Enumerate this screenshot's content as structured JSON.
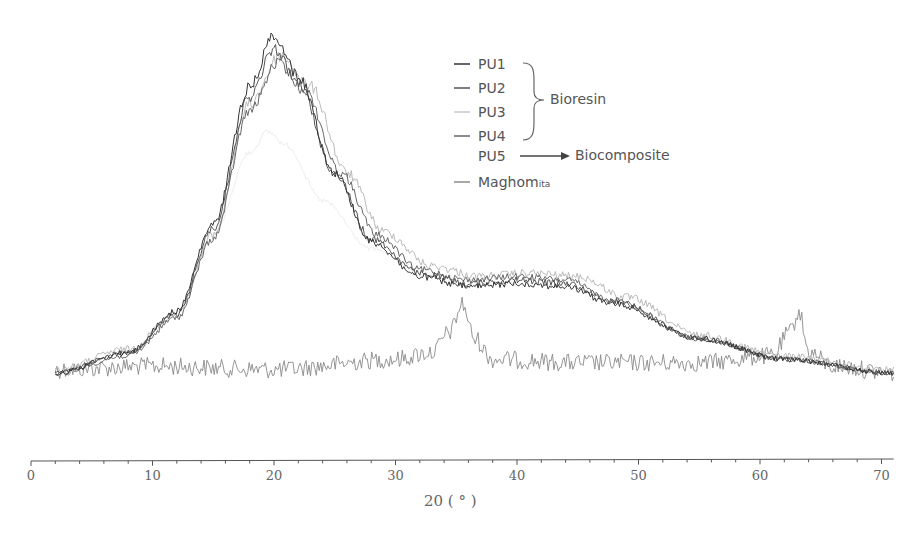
{
  "chart_data": {
    "type": "line",
    "title": "",
    "xlabel": "2θ (°)",
    "xlabel_display": "20  ( ° )",
    "ylabel": "",
    "xlim": [
      0,
      71
    ],
    "x_ticks": [
      0,
      10,
      20,
      30,
      40,
      50,
      60,
      70
    ],
    "x_tick_labels": [
      "0",
      "10",
      "20",
      "30",
      "40",
      "50",
      "60",
      "70"
    ],
    "minor_tick_step": 2,
    "grid": false,
    "y_axis_visible": false,
    "legend_position": "upper-center",
    "series": [
      {
        "name": "PU1",
        "color": "#333333",
        "peak_x": 20,
        "peak_y": 1.0,
        "x_range": [
          2,
          71
        ],
        "points": [
          [
            2,
            0.02
          ],
          [
            8,
            0.08
          ],
          [
            12,
            0.2
          ],
          [
            15,
            0.45
          ],
          [
            18,
            0.85
          ],
          [
            20,
            1.0
          ],
          [
            22,
            0.88
          ],
          [
            25,
            0.6
          ],
          [
            28,
            0.4
          ],
          [
            32,
            0.3
          ],
          [
            36,
            0.27
          ],
          [
            40,
            0.28
          ],
          [
            44,
            0.27
          ],
          [
            48,
            0.22
          ],
          [
            55,
            0.12
          ],
          [
            62,
            0.06
          ],
          [
            71,
            0.02
          ]
        ]
      },
      {
        "name": "PU2",
        "color": "#555555",
        "peak_x": 20,
        "peak_y": 0.96,
        "x_range": [
          2,
          71
        ],
        "points": [
          [
            2,
            0.02
          ],
          [
            8,
            0.08
          ],
          [
            12,
            0.19
          ],
          [
            15,
            0.44
          ],
          [
            18,
            0.82
          ],
          [
            20,
            0.96
          ],
          [
            22,
            0.86
          ],
          [
            25,
            0.6
          ],
          [
            28,
            0.41
          ],
          [
            32,
            0.31
          ],
          [
            36,
            0.28
          ],
          [
            40,
            0.29
          ],
          [
            44,
            0.28
          ],
          [
            48,
            0.23
          ],
          [
            55,
            0.12
          ],
          [
            62,
            0.06
          ],
          [
            71,
            0.02
          ]
        ]
      },
      {
        "name": "PU3",
        "color": "#bbbbbb",
        "peak_x": 20.5,
        "peak_y": 0.94,
        "x_range": [
          2,
          71
        ],
        "points": [
          [
            2,
            0.03
          ],
          [
            8,
            0.09
          ],
          [
            12,
            0.19
          ],
          [
            15,
            0.42
          ],
          [
            18,
            0.8
          ],
          [
            20.5,
            0.94
          ],
          [
            23,
            0.85
          ],
          [
            26,
            0.6
          ],
          [
            29,
            0.43
          ],
          [
            33,
            0.33
          ],
          [
            37,
            0.3
          ],
          [
            41,
            0.31
          ],
          [
            45,
            0.3
          ],
          [
            49,
            0.24
          ],
          [
            55,
            0.13
          ],
          [
            62,
            0.07
          ],
          [
            71,
            0.03
          ]
        ]
      },
      {
        "name": "PU4",
        "color": "#666666",
        "peak_x": 20.3,
        "peak_y": 0.92,
        "x_range": [
          2,
          71
        ],
        "points": [
          [
            2,
            0.02
          ],
          [
            8,
            0.07
          ],
          [
            12,
            0.18
          ],
          [
            15,
            0.41
          ],
          [
            18,
            0.78
          ],
          [
            20.3,
            0.92
          ],
          [
            22.5,
            0.84
          ],
          [
            25.5,
            0.6
          ],
          [
            28.5,
            0.42
          ],
          [
            32,
            0.32
          ],
          [
            36,
            0.29
          ],
          [
            40,
            0.3
          ],
          [
            44,
            0.29
          ],
          [
            48,
            0.23
          ],
          [
            55,
            0.12
          ],
          [
            62,
            0.06
          ],
          [
            71,
            0.02
          ]
        ]
      },
      {
        "name": "PU5",
        "color": "#eeeeee",
        "peak_x": 19.5,
        "peak_y": 0.72,
        "x_range": [
          8,
          40
        ],
        "points": [
          [
            8,
            0.08
          ],
          [
            12,
            0.2
          ],
          [
            15,
            0.42
          ],
          [
            18,
            0.66
          ],
          [
            19.5,
            0.72
          ],
          [
            21,
            0.68
          ],
          [
            24,
            0.52
          ],
          [
            28,
            0.38
          ],
          [
            33,
            0.3
          ],
          [
            40,
            0.28
          ]
        ]
      },
      {
        "name": "Maghomita",
        "color": "#8a8a8a",
        "x_range": [
          2,
          71
        ],
        "points": [
          [
            2,
            0.03
          ],
          [
            10,
            0.04
          ],
          [
            20,
            0.03
          ],
          [
            30,
            0.06
          ],
          [
            33,
            0.08
          ],
          [
            34.5,
            0.14
          ],
          [
            35.5,
            0.22
          ],
          [
            36.5,
            0.12
          ],
          [
            38,
            0.06
          ],
          [
            45,
            0.05
          ],
          [
            55,
            0.05
          ],
          [
            61,
            0.07
          ],
          [
            62.5,
            0.14
          ],
          [
            63.2,
            0.2
          ],
          [
            64,
            0.08
          ],
          [
            66,
            0.04
          ],
          [
            71,
            0.02
          ]
        ]
      }
    ],
    "annotations": [
      {
        "text": "Bioresin",
        "groups": [
          "PU1",
          "PU2",
          "PU3",
          "PU4"
        ],
        "type": "brace"
      },
      {
        "text": "Biocomposite",
        "groups": [
          "PU5"
        ],
        "type": "arrow"
      }
    ]
  },
  "legend": {
    "items": [
      {
        "label": "PU1",
        "sub": "",
        "color": "#333333"
      },
      {
        "label": "PU2",
        "sub": "",
        "color": "#555555"
      },
      {
        "label": "PU3",
        "sub": "",
        "color": "#c8c8c8"
      },
      {
        "label": "PU4",
        "sub": "",
        "color": "#666666"
      },
      {
        "label": "PU5",
        "sub": "",
        "color": "#ffffff"
      },
      {
        "label": "Maghom",
        "sub": "ita",
        "color": "#8a8a8a"
      }
    ],
    "bioresin_label": "Bioresin",
    "biocomposite_label": "Biocomposite"
  },
  "axis": {
    "x_title": "20  ( ° )"
  }
}
